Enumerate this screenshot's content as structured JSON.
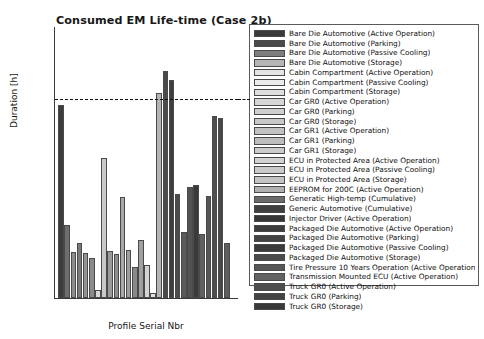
{
  "chart_data": {
    "type": "bar",
    "title": "Consumed EM Life-time  (Case 2b)",
    "xlabel": "Profile Serial Nbr",
    "ylabel": "Duration [h]",
    "yscale": "log",
    "ylim": [
      100,
      1000000
    ],
    "xlim": [
      0,
      30
    ],
    "grid": false,
    "y_tick_labels": [
      "10",
      "10",
      "10",
      "10",
      "10"
    ],
    "y_tick_exponents": [
      "2",
      "3",
      "4",
      "5",
      "6"
    ],
    "y_tick_values": [
      100,
      1000,
      10000,
      100000,
      1000000
    ],
    "x_tick_labels": [
      "0",
      "10",
      "20",
      "30"
    ],
    "x_tick_values": [
      0,
      10,
      20,
      30
    ],
    "annotations": [
      {
        "type": "hline",
        "label": "threshold",
        "value": 87000,
        "style": "dashed",
        "color": "#101010"
      }
    ],
    "categories": [
      1,
      2,
      3,
      4,
      5,
      6,
      7,
      8,
      9,
      10,
      11,
      12,
      13,
      14,
      15,
      16,
      17,
      18,
      19,
      20,
      21,
      22,
      23,
      24,
      25,
      26,
      27,
      28
    ],
    "values": [
      70000,
      1200,
      480,
      650,
      460,
      390,
      130,
      11500,
      490,
      440,
      3100,
      500,
      285,
      720,
      310,
      120,
      105000,
      215000,
      160000,
      3400,
      920,
      4300,
      4600,
      880,
      3200,
      48000,
      45000,
      640
    ],
    "bar_colors": [
      "#3c3c3c",
      "#6e6e6e",
      "#8c8c8c",
      "#7a7a7a",
      "#949494",
      "#8a8a8a",
      "#d8d8d8",
      "#c8c8c8",
      "#9a9a9a",
      "#8e8e8e",
      "#a8a8a8",
      "#9e9e9e",
      "#8a8a8a",
      "#a0a0a0",
      "#d4d4d4",
      "#e2e2e2",
      "#b4b4b4",
      "#4a4a4a",
      "#3e3e3e",
      "#4c4c4c",
      "#5a5a5a",
      "#525252",
      "#3a3a3a",
      "#606060",
      "#565656",
      "#4e4e4e",
      "#484848",
      "#5e5e5e"
    ]
  },
  "legend": {
    "items": [
      {
        "label": "Bare Die Automotive (Active Operation)",
        "color": "#3a3a3a"
      },
      {
        "label": "Bare Die Automotive (Parking)",
        "color": "#4a4a4a"
      },
      {
        "label": "Bare Die Automotive (Passive Cooling)",
        "color": "#7d7d7d"
      },
      {
        "label": "Bare Die Automotive (Storage)",
        "color": "#b5b5b5"
      },
      {
        "label": "Cabin Compartment (Active Operation)",
        "color": "#e4e4e4"
      },
      {
        "label": "Cabin Compartment (Passive Cooling)",
        "color": "#ececec"
      },
      {
        "label": "Cabin Compartment (Storage)",
        "color": "#dedede"
      },
      {
        "label": "Car GR0 (Active Operation)",
        "color": "#d6d6d6"
      },
      {
        "label": "Car GR0 (Parking)",
        "color": "#cfcfcf"
      },
      {
        "label": "Car GR0 (Storage)",
        "color": "#c8c8c8"
      },
      {
        "label": "Car GR1 (Active Operation)",
        "color": "#c2c2c2"
      },
      {
        "label": "Car GR1 (Parking)",
        "color": "#bdbdbd"
      },
      {
        "label": "Car GR1 (Storage)",
        "color": "#cccccc"
      },
      {
        "label": "ECU in Protected Area (Active Operation)",
        "color": "#d2d2d2"
      },
      {
        "label": "ECU in Protected Area (Passive Cooling)",
        "color": "#cacaca"
      },
      {
        "label": "ECU in Protected Area (Storage)",
        "color": "#c4c4c4"
      },
      {
        "label": "EEPROM for 200C (Active Operation)",
        "color": "#b0b0b0"
      },
      {
        "label": "Generatic High-temp (Cumulative)",
        "color": "#6b6b6b"
      },
      {
        "label": "Generic Automotive (Cumulative)",
        "color": "#3f3f3f"
      },
      {
        "label": "Injector Driver (Active Operation)",
        "color": "#353535"
      },
      {
        "label": "Packaged Die Automotive (Active Operation)",
        "color": "#3c3c3c"
      },
      {
        "label": "Packaged Die Automotive (Parking)",
        "color": "#434343"
      },
      {
        "label": "Packaged Die Automotive (Passive Cooling)",
        "color": "#3a3a3a"
      },
      {
        "label": "Packaged Die Automotive (Storage)",
        "color": "#4a4a4a"
      },
      {
        "label": "Tire Pressure 10 Years Operation (Active Operation)",
        "color": "#565656"
      },
      {
        "label": "Transmission Mounted ECU (Active Operation)",
        "color": "#626262"
      },
      {
        "label": "Truck GR0 (Active Operation)",
        "color": "#4e4e4e"
      },
      {
        "label": "Truck GR0 (Parking)",
        "color": "#444444"
      },
      {
        "label": "Truck GR0 (Storage)",
        "color": "#3a3a3a"
      }
    ]
  }
}
